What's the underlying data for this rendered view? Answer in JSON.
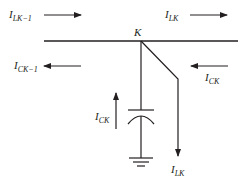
{
  "diagram": {
    "title": "",
    "colors": {
      "line": "#231f20",
      "background": "#ffffff"
    },
    "node": {
      "label": "K"
    },
    "labels": {
      "i_lk_minus_1": {
        "main": "I",
        "sub": "LK−1"
      },
      "i_lk_top": {
        "main": "I",
        "sub": "LK"
      },
      "i_ck_minus_1": {
        "main": "I",
        "sub": "CK−1"
      },
      "i_ck_right": {
        "main": "I",
        "sub": "CK"
      },
      "i_ck_cap": {
        "main": "I",
        "sub": "CK"
      },
      "i_lk_load": {
        "main": "I",
        "sub": "LK"
      }
    },
    "elements": [
      "bus line",
      "node K",
      "capacitor to ground",
      "ground symbol",
      "load branch with downward current",
      "current arrows"
    ]
  }
}
